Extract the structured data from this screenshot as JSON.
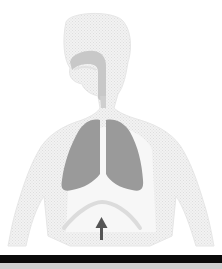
{
  "diagram": {
    "parts": [
      {
        "id": "body-silhouette",
        "label": "body outline"
      },
      {
        "id": "airway",
        "label": "nasal cavity, mouth and trachea"
      },
      {
        "id": "left-lung",
        "label": "left lung"
      },
      {
        "id": "right-lung",
        "label": "right lung"
      },
      {
        "id": "diaphragm",
        "label": "diaphragm"
      },
      {
        "id": "arrow",
        "label": "upward arrow",
        "direction": "up"
      }
    ],
    "colors": {
      "silhouette": "#ececec",
      "silhouette_edge": "#e0e0e0",
      "airway": "#c8c8c8",
      "lungs": "#9a9a9a",
      "diaphragm": "#dcdcdc",
      "arrow": "#555555",
      "bottom_bar": "#0a0a0a",
      "bottom_strip": "#cfcfcf"
    }
  }
}
